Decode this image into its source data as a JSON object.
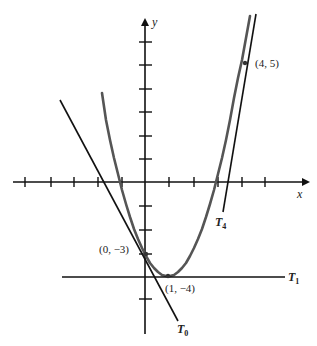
{
  "diagram": {
    "type": "function-graph-with-tangent-lines",
    "function": "y = x^2 - 2x - 3",
    "axes": {
      "x_label": "x",
      "y_label": "y",
      "x_ticks": [
        -5,
        -4,
        -3,
        -2,
        -1,
        1,
        2,
        3,
        4,
        5
      ],
      "y_ticks_positive": [
        1,
        2,
        3,
        4,
        5,
        6
      ],
      "y_ticks_negative": [
        -1,
        -2,
        -3,
        -4,
        -5
      ]
    },
    "points": [
      {
        "label": "(4, 5)",
        "x": 4,
        "y": 5
      },
      {
        "label": "(0, −3)",
        "x": 0,
        "y": -3
      },
      {
        "label": "(1, −4)",
        "x": 1,
        "y": -4
      }
    ],
    "tangent_lines": [
      {
        "name": "T",
        "sub": "0",
        "at_x": 0,
        "equation": "y = -2x - 3"
      },
      {
        "name": "T",
        "sub": "1",
        "at_x": 1,
        "equation": "y = -4"
      },
      {
        "name": "T",
        "sub": "4",
        "at_x": 4,
        "equation": "y = 6x - 19"
      }
    ],
    "colors": {
      "curve": "#555555",
      "lines": "#111111",
      "axes": "#111111"
    }
  }
}
